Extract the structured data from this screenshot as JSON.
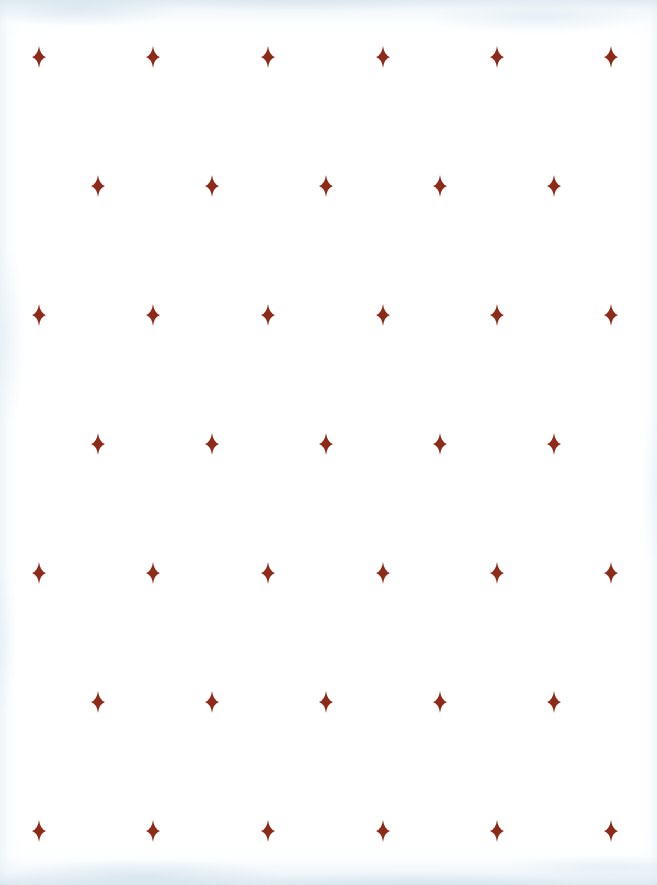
{
  "artwork": {
    "title": "Four-Pointed Star Pattern",
    "description": "Repeating offset grid of four-pointed sparkle stars on white paper",
    "motif_name": "four-pointed-star",
    "canvas": {
      "width": 657,
      "height": 885,
      "background_color": "#ffffff",
      "edge_tint_color": "#dde9f0"
    },
    "motif": {
      "color": "#8e2a18",
      "width": 14,
      "height": 22,
      "points": 4,
      "style": "concave-curved"
    },
    "layout": {
      "type": "offset-grid",
      "row_spacing": 129,
      "major_row_count": 4,
      "minor_row_count": 3,
      "major_row_star_count": 6,
      "minor_row_star_count": 5,
      "major_row_x_positions": [
        39,
        153,
        268,
        383,
        497,
        611
      ],
      "minor_row_x_positions": [
        98,
        212,
        326,
        440,
        554
      ],
      "major_row_y_positions": [
        57,
        315,
        573,
        831
      ],
      "minor_row_y_positions": [
        186,
        444,
        702
      ]
    },
    "stars": [
      {
        "x": 39,
        "y": 57,
        "row": 1,
        "col": 1
      },
      {
        "x": 153,
        "y": 57,
        "row": 1,
        "col": 2
      },
      {
        "x": 268,
        "y": 57,
        "row": 1,
        "col": 3
      },
      {
        "x": 383,
        "y": 57,
        "row": 1,
        "col": 4
      },
      {
        "x": 497,
        "y": 57,
        "row": 1,
        "col": 5
      },
      {
        "x": 611,
        "y": 57,
        "row": 1,
        "col": 6
      },
      {
        "x": 98,
        "y": 186,
        "row": 2,
        "col": 1
      },
      {
        "x": 212,
        "y": 186,
        "row": 2,
        "col": 2
      },
      {
        "x": 326,
        "y": 186,
        "row": 2,
        "col": 3
      },
      {
        "x": 440,
        "y": 186,
        "row": 2,
        "col": 4
      },
      {
        "x": 554,
        "y": 186,
        "row": 2,
        "col": 5
      },
      {
        "x": 39,
        "y": 315,
        "row": 3,
        "col": 1
      },
      {
        "x": 153,
        "y": 315,
        "row": 3,
        "col": 2
      },
      {
        "x": 268,
        "y": 315,
        "row": 3,
        "col": 3
      },
      {
        "x": 383,
        "y": 315,
        "row": 3,
        "col": 4
      },
      {
        "x": 497,
        "y": 315,
        "row": 3,
        "col": 5
      },
      {
        "x": 611,
        "y": 315,
        "row": 3,
        "col": 6
      },
      {
        "x": 98,
        "y": 444,
        "row": 4,
        "col": 1
      },
      {
        "x": 212,
        "y": 444,
        "row": 4,
        "col": 2
      },
      {
        "x": 326,
        "y": 444,
        "row": 4,
        "col": 3
      },
      {
        "x": 440,
        "y": 444,
        "row": 4,
        "col": 4
      },
      {
        "x": 554,
        "y": 444,
        "row": 4,
        "col": 5
      },
      {
        "x": 39,
        "y": 573,
        "row": 5,
        "col": 1
      },
      {
        "x": 153,
        "y": 573,
        "row": 5,
        "col": 2
      },
      {
        "x": 268,
        "y": 573,
        "row": 5,
        "col": 3
      },
      {
        "x": 383,
        "y": 573,
        "row": 5,
        "col": 4
      },
      {
        "x": 497,
        "y": 573,
        "row": 5,
        "col": 5
      },
      {
        "x": 611,
        "y": 573,
        "row": 5,
        "col": 6
      },
      {
        "x": 98,
        "y": 702,
        "row": 6,
        "col": 1
      },
      {
        "x": 212,
        "y": 702,
        "row": 6,
        "col": 2
      },
      {
        "x": 326,
        "y": 702,
        "row": 6,
        "col": 3
      },
      {
        "x": 440,
        "y": 702,
        "row": 6,
        "col": 4
      },
      {
        "x": 554,
        "y": 702,
        "row": 6,
        "col": 5
      },
      {
        "x": 39,
        "y": 831,
        "row": 7,
        "col": 1
      },
      {
        "x": 153,
        "y": 831,
        "row": 7,
        "col": 2
      },
      {
        "x": 268,
        "y": 831,
        "row": 7,
        "col": 3
      },
      {
        "x": 383,
        "y": 831,
        "row": 7,
        "col": 4
      },
      {
        "x": 497,
        "y": 831,
        "row": 7,
        "col": 5
      },
      {
        "x": 611,
        "y": 831,
        "row": 7,
        "col": 6
      }
    ]
  }
}
